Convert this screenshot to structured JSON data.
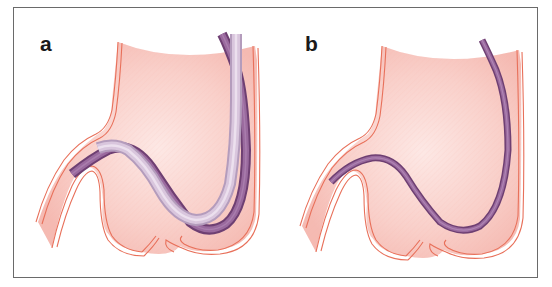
{
  "figure": {
    "panels": [
      {
        "label": "a",
        "description": "stomach with two endoscope paths: dark purple and light lilac tube forming a loop along greater curvature"
      },
      {
        "label": "b",
        "description": "stomach with single purple endoscope along greater curvature"
      }
    ],
    "colors": {
      "stomach_fill": "#f7c3bc",
      "stomach_fill_light": "#fde6e2",
      "stomach_outline": "#e8705a",
      "tube_dark": "#8a5a8c",
      "tube_dark_edge": "#6e3f72",
      "tube_light": "#d8c4dc",
      "tube_light_edge": "#b49cbc",
      "frame": "#6a6a6a",
      "label": "#1a1a1a"
    }
  }
}
